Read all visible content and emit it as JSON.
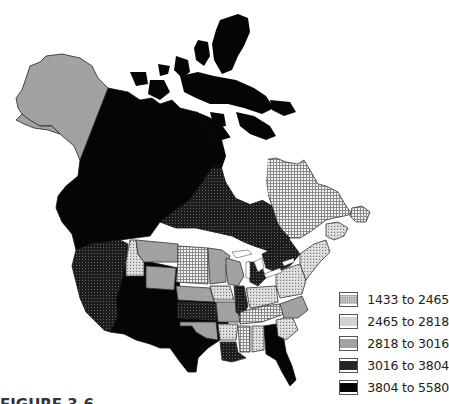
{
  "figure": {
    "type": "choropleth-map",
    "region": "North America (Canada, United States, Alaska)",
    "caption_visible_fragment": "FIGURE 3.6"
  },
  "legend": {
    "items": [
      {
        "label": "1433 to 2465",
        "pattern": "fine-grid-light",
        "color": "#e6e6e6"
      },
      {
        "label": "2465 to 2818",
        "pattern": "stipple-light",
        "color": "#cfcfcf"
      },
      {
        "label": "2818 to 3016",
        "pattern": "solid-gray",
        "color": "#a8a8a8"
      },
      {
        "label": "3016 to 3804",
        "pattern": "fine-grid-dark",
        "color": "#2a2a2a"
      },
      {
        "label": "3804 to 5580",
        "pattern": "solid-black",
        "color": "#0a0a0a"
      }
    ]
  },
  "regions": [
    {
      "name": "Alaska",
      "class": 2
    },
    {
      "name": "Yukon",
      "class": 4
    },
    {
      "name": "Northwest Territories / Nunavut mainland",
      "class": 4
    },
    {
      "name": "Arctic Archipelago",
      "class": 4
    },
    {
      "name": "British Columbia",
      "class": 4
    },
    {
      "name": "Alberta",
      "class": 4
    },
    {
      "name": "Saskatchewan",
      "class": 3
    },
    {
      "name": "Manitoba",
      "class": 3
    },
    {
      "name": "Ontario",
      "class": 3
    },
    {
      "name": "Quebec",
      "class": 0
    },
    {
      "name": "Labrador / Newfoundland",
      "class": 0
    },
    {
      "name": "Maritimes",
      "class": 1
    },
    {
      "name": "Washington",
      "class": 3
    },
    {
      "name": "Oregon",
      "class": 3
    },
    {
      "name": "California",
      "class": 3
    },
    {
      "name": "Nevada",
      "class": 3
    },
    {
      "name": "Idaho",
      "class": 1
    },
    {
      "name": "Montana",
      "class": 2
    },
    {
      "name": "Wyoming",
      "class": 2
    },
    {
      "name": "Utah",
      "class": 4
    },
    {
      "name": "Colorado",
      "class": 4
    },
    {
      "name": "Arizona",
      "class": 4
    },
    {
      "name": "New Mexico",
      "class": 4
    },
    {
      "name": "North Dakota",
      "class": 0
    },
    {
      "name": "South Dakota",
      "class": 0
    },
    {
      "name": "Nebraska",
      "class": 2
    },
    {
      "name": "Kansas",
      "class": 3
    },
    {
      "name": "Oklahoma",
      "class": 2
    },
    {
      "name": "Texas",
      "class": 4
    },
    {
      "name": "Minnesota",
      "class": 2
    },
    {
      "name": "Iowa",
      "class": 1
    },
    {
      "name": "Missouri",
      "class": 2
    },
    {
      "name": "Arkansas",
      "class": 1
    },
    {
      "name": "Louisiana",
      "class": 3
    },
    {
      "name": "Wisconsin",
      "class": 2
    },
    {
      "name": "Illinois",
      "class": 3
    },
    {
      "name": "Michigan",
      "class": 3
    },
    {
      "name": "Indiana",
      "class": 1
    },
    {
      "name": "Ohio",
      "class": 1
    },
    {
      "name": "Kentucky",
      "class": 0
    },
    {
      "name": "Tennessee",
      "class": 0
    },
    {
      "name": "Mississippi",
      "class": 0
    },
    {
      "name": "Alabama",
      "class": 1
    },
    {
      "name": "Georgia",
      "class": 1
    },
    {
      "name": "Florida",
      "class": 4
    },
    {
      "name": "South Carolina",
      "class": 1
    },
    {
      "name": "North Carolina",
      "class": 2
    },
    {
      "name": "Virginia",
      "class": 2
    },
    {
      "name": "Pennsylvania",
      "class": 1
    },
    {
      "name": "New York",
      "class": 1
    },
    {
      "name": "New England",
      "class": 1
    }
  ]
}
